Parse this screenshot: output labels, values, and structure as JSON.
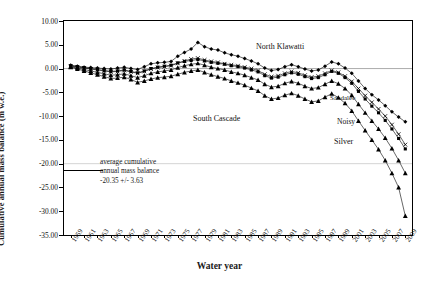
{
  "axes": {
    "ylabel": "Cumulative annual mass balance (m w.e.)",
    "xlabel": "Water year",
    "yticks": [
      "10.00",
      "5.00",
      "0.00",
      "-5.00",
      "-10.00",
      "-15.00",
      "-20.00",
      "-25.00",
      "-30.00",
      "-35.00"
    ],
    "xticks": [
      "1959",
      "1961",
      "1963",
      "1965",
      "1967",
      "1969",
      "1971",
      "1973",
      "1975",
      "1977",
      "1979",
      "1981",
      "1983",
      "1985",
      "1987",
      "1989",
      "1991",
      "1993",
      "1995",
      "1997",
      "1999",
      "2001",
      "2003",
      "2005",
      "2007",
      "2009"
    ]
  },
  "annotation": {
    "line1": "average cumulative",
    "line2": "annual mass balance",
    "line3": "-20.35 +/- 3.63"
  },
  "series_labels": {
    "north_klawatti": "North Klawatti",
    "south_cascade": "South Cascade",
    "sandalee": "Sandalee",
    "noisy": "Noisy",
    "silver": "Silver"
  },
  "chart_data": {
    "type": "line",
    "title": "",
    "xlabel": "Water year",
    "ylabel": "Cumulative annual mass balance (m w.e.)",
    "xlim": [
      1958,
      2010
    ],
    "ylim": [
      -35,
      10
    ],
    "ytick_step": 5,
    "grid": false,
    "legend": "inline-labels",
    "reference_line": {
      "value": -20.35,
      "uncertainty": 3.63,
      "label": "average cumulative annual mass balance"
    },
    "x": [
      1959,
      1960,
      1961,
      1962,
      1963,
      1964,
      1965,
      1966,
      1967,
      1968,
      1969,
      1970,
      1971,
      1972,
      1973,
      1974,
      1975,
      1976,
      1977,
      1978,
      1979,
      1980,
      1981,
      1982,
      1983,
      1984,
      1985,
      1986,
      1987,
      1988,
      1989,
      1990,
      1991,
      1992,
      1993,
      1994,
      1995,
      1996,
      1997,
      1998,
      1999,
      2000,
      2001,
      2002,
      2003,
      2004,
      2005,
      2006,
      2007,
      2008,
      2009
    ],
    "series": [
      {
        "name": "North Klawatti",
        "marker": "diamond",
        "values": [
          0.7,
          0.5,
          0.3,
          0.2,
          0.1,
          0.0,
          -0.1,
          0.1,
          0.3,
          0.0,
          -0.2,
          0.4,
          1.0,
          1.2,
          1.3,
          1.5,
          2.6,
          3.4,
          4.1,
          5.5,
          4.6,
          4.1,
          3.9,
          3.3,
          2.9,
          2.6,
          2.1,
          1.6,
          1.0,
          0.1,
          -0.4,
          -0.2,
          0.4,
          0.8,
          0.4,
          -0.1,
          -0.5,
          -0.3,
          0.5,
          1.4,
          1.0,
          0.1,
          -1.0,
          -2.6,
          -4.2,
          -5.5,
          -6.6,
          -7.8,
          -9.1,
          -10.2,
          -11.2
        ]
      },
      {
        "name": "Sandalee",
        "marker": "cross",
        "values": [
          0.5,
          0.3,
          0.1,
          -0.1,
          -0.3,
          -0.5,
          -0.7,
          -0.6,
          -0.4,
          -0.7,
          -1.0,
          -0.6,
          -0.1,
          0.2,
          0.4,
          0.6,
          1.1,
          1.6,
          2.0,
          2.2,
          1.8,
          1.5,
          1.3,
          1.0,
          0.8,
          0.6,
          0.3,
          0.0,
          -0.4,
          -1.2,
          -1.7,
          -1.5,
          -1.0,
          -0.6,
          -0.9,
          -1.4,
          -1.8,
          -1.6,
          -1.0,
          -0.4,
          -0.8,
          -1.6,
          -2.7,
          -4.2,
          -5.7,
          -7.1,
          -8.5,
          -10.0,
          -11.8,
          -13.8,
          -16.0
        ]
      },
      {
        "name": "Noisy",
        "marker": "square",
        "values": [
          0.6,
          0.4,
          0.2,
          0.0,
          -0.2,
          -0.4,
          -0.6,
          -0.5,
          -0.3,
          -0.6,
          -0.9,
          -0.5,
          0.0,
          0.3,
          0.5,
          0.7,
          1.2,
          1.5,
          1.7,
          1.9,
          1.6,
          1.3,
          1.1,
          0.9,
          0.6,
          0.4,
          0.1,
          -0.3,
          -0.7,
          -1.5,
          -2.0,
          -1.8,
          -1.3,
          -0.9,
          -1.2,
          -1.7,
          -2.1,
          -1.9,
          -1.3,
          -0.6,
          -1.0,
          -1.9,
          -3.1,
          -4.8,
          -6.4,
          -7.9,
          -9.3,
          -10.9,
          -12.7,
          -14.7,
          -16.9
        ]
      },
      {
        "name": "Silver",
        "marker": "triangle",
        "values": [
          0.4,
          0.1,
          -0.2,
          -0.5,
          -0.8,
          -1.1,
          -1.4,
          -1.3,
          -1.1,
          -1.5,
          -1.9,
          -1.5,
          -1.0,
          -0.7,
          -0.5,
          -0.3,
          0.2,
          0.6,
          0.9,
          1.1,
          0.7,
          0.3,
          0.0,
          -0.3,
          -0.7,
          -1.0,
          -1.4,
          -1.9,
          -2.4,
          -3.3,
          -3.9,
          -3.7,
          -3.1,
          -2.7,
          -3.1,
          -3.7,
          -4.2,
          -4.0,
          -3.3,
          -2.6,
          -3.2,
          -4.2,
          -5.6,
          -7.5,
          -9.3,
          -11.0,
          -12.7,
          -14.6,
          -16.8,
          -19.3,
          -22.0
        ]
      },
      {
        "name": "South Cascade",
        "marker": "triangle",
        "values": [
          0.3,
          -0.1,
          -0.5,
          -0.9,
          -1.3,
          -1.7,
          -2.1,
          -2.0,
          -1.8,
          -2.3,
          -2.9,
          -2.6,
          -2.2,
          -1.9,
          -1.8,
          -1.6,
          -1.2,
          -0.8,
          -0.5,
          -0.3,
          -0.8,
          -1.3,
          -1.7,
          -2.1,
          -2.6,
          -3.0,
          -3.5,
          -4.1,
          -4.7,
          -5.7,
          -6.4,
          -6.2,
          -5.6,
          -5.2,
          -5.7,
          -6.4,
          -7.0,
          -6.8,
          -6.0,
          -5.3,
          -6.1,
          -7.3,
          -8.9,
          -11.0,
          -13.0,
          -15.0,
          -17.0,
          -19.3,
          -22.0,
          -25.0,
          -31.0
        ]
      }
    ]
  }
}
